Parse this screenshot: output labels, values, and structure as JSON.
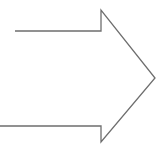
{
  "canvas": {
    "width": 167,
    "height": 148,
    "background_color": "#ffffff",
    "title": "Right-pointing arrow outline"
  },
  "shape": {
    "name": "right-arrow",
    "style": "open outline, unfilled",
    "stroke_color": "#6e6e6e",
    "stroke_width": 1.3,
    "fill_color": "none",
    "direction": "right",
    "closed": false,
    "description": "Hollow right-pointing arrow drawn as a single open polyline; the shaft's left end is open and the lower shaft edge runs off the left border of the canvas."
  },
  "chart_data": {
    "type": "diagram",
    "title": "Right-pointing arrow outline",
    "shapes": [
      {
        "id": "arrow-polyline",
        "label": "right-arrow",
        "kind": "polyline",
        "closed": false,
        "stroke": "#6e6e6e",
        "stroke_width": 1.3,
        "fill": "none",
        "points": [
          [
            15,
            31
          ],
          [
            101,
            31
          ],
          [
            101,
            10
          ],
          [
            155,
            78
          ],
          [
            101,
            142
          ],
          [
            101,
            126
          ],
          [
            0,
            126
          ]
        ],
        "vertex_labels": [
          "shaft-top-left-open-end",
          "shaft-top-right-notch",
          "arrowhead-top-barb",
          "arrowhead-tip",
          "arrowhead-bottom-barb",
          "shaft-bottom-right-notch",
          "shaft-bottom-left-open-edge"
        ]
      }
    ],
    "xlim": [
      0,
      167
    ],
    "ylim": [
      0,
      148
    ],
    "grid": false,
    "legend": false,
    "axes_visible": false
  }
}
